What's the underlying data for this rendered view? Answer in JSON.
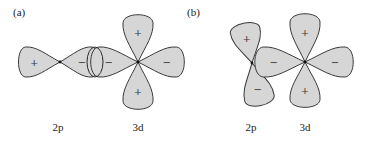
{
  "figure": {
    "panels": [
      {
        "id": "a",
        "label": "(a)",
        "label_pos": [
          13,
          16
        ],
        "orbitals": [
          {
            "name": "2p",
            "label": "2p",
            "label_pos": [
              58,
              131
            ],
            "center": [
              60,
              62
            ],
            "lobes": [
              {
                "dir": 180,
                "length": 43,
                "width": 30,
                "sign": "+"
              },
              {
                "dir": 0,
                "length": 40,
                "width": 30,
                "sign": "−",
                "sign_offset": 22
              }
            ]
          },
          {
            "name": "3d",
            "label": "3d",
            "label_pos": [
              138,
              131
            ],
            "center": [
              138,
              62
            ],
            "lobes": [
              {
                "dir": 270,
                "length": 49,
                "width": 30,
                "sign": "+"
              },
              {
                "dir": 90,
                "length": 49,
                "width": 30,
                "sign": "+"
              },
              {
                "dir": 180,
                "length": 49,
                "width": 30,
                "sign": "−"
              },
              {
                "dir": 0,
                "length": 48,
                "width": 30,
                "sign": "−"
              }
            ]
          }
        ],
        "overlap_ellipse": {
          "cx": 95,
          "cy": 62,
          "rx": 8,
          "ry": 15
        }
      },
      {
        "id": "b",
        "label": "(b)",
        "label_pos": [
          187,
          16
        ],
        "orbitals": [
          {
            "name": "2p",
            "label": "2p",
            "label_pos": [
              251,
              131
            ],
            "center": [
              252,
              63
            ],
            "lobes": [
              {
                "dir": 258,
                "length": 42,
                "width": 30,
                "sign": "+"
              },
              {
                "dir": 78,
                "length": 45,
                "width": 30,
                "sign": "−"
              }
            ]
          },
          {
            "name": "3d",
            "label": "3d",
            "label_pos": [
              305,
              131
            ],
            "center": [
              305,
              62
            ],
            "lobes": [
              {
                "dir": 270,
                "length": 50,
                "width": 30,
                "sign": "+"
              },
              {
                "dir": 90,
                "length": 47,
                "width": 30,
                "sign": "+"
              },
              {
                "dir": 180,
                "length": 52,
                "width": 30,
                "sign": "−"
              },
              {
                "dir": 0,
                "length": 50,
                "width": 30,
                "sign": "−"
              }
            ]
          }
        ]
      }
    ]
  }
}
